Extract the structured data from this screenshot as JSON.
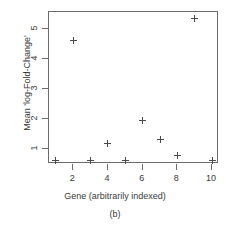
{
  "chart_data": {
    "type": "scatter",
    "title": "",
    "xlabel": "Gene (arbitrarily indexed)",
    "ylabel": "Mean 'log-Fold-Change'",
    "caption": "(b)",
    "x": [
      1,
      2,
      3,
      4,
      5,
      6,
      7,
      8,
      9,
      10
    ],
    "values": [
      0.62,
      4.6,
      0.62,
      1.17,
      0.63,
      1.93,
      1.3,
      0.78,
      5.35,
      0.62
    ],
    "series": [
      {
        "name": "Mean log-Fold-Change",
        "values": [
          0.62,
          4.6,
          0.62,
          1.17,
          0.63,
          1.93,
          1.3,
          0.78,
          5.35,
          0.62
        ]
      }
    ],
    "xlim": [
      0.6,
      10.4
    ],
    "ylim": [
      0.5,
      5.55
    ],
    "xticks": [
      2,
      4,
      6,
      8,
      10
    ],
    "xtick_labels": [
      "2",
      "4",
      "6",
      "8",
      "10"
    ],
    "yticks": [
      1,
      2,
      3,
      4,
      5
    ],
    "ytick_labels": [
      "1",
      "2",
      "3",
      "4",
      "5"
    ],
    "grid": false,
    "legend": null,
    "marker": "plus",
    "marker_color": "#4a4a4a",
    "axis_color": "#6b6b6b"
  }
}
